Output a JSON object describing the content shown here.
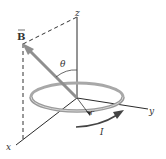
{
  "diagram": {
    "labels": {
      "z_axis": "z",
      "y_axis": "y",
      "x_axis": "x",
      "field": "B",
      "angle": "θ",
      "radius": "r",
      "current": "I"
    },
    "colors": {
      "axis": "#2b2b2b",
      "loop": "#9a9a9a",
      "arrow": "#8a8a8a",
      "dashed": "#333333"
    }
  }
}
